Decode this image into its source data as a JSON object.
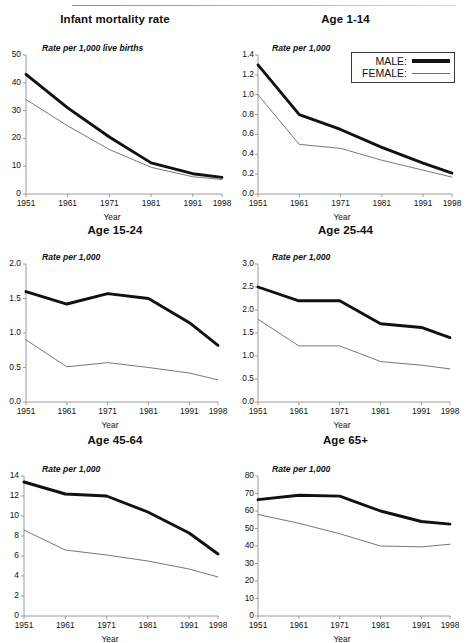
{
  "legend": {
    "male_label": "MALE:",
    "female_label": "FEMALE:",
    "position": "top-right of Age 1-14 panel"
  },
  "axis_titles": {
    "x": "Year",
    "y_infant": "Rate per 1,000 live births",
    "y_standard": "Rate per 1,000"
  },
  "chart_data": [
    {
      "type": "line",
      "title": "Infant mortality rate",
      "xlabel": "Year",
      "ylabel": "Rate per 1,000 live births",
      "x": [
        1951,
        1961,
        1971,
        1981,
        1991,
        1998
      ],
      "xtick_labels": [
        "1951",
        "1961",
        "1971",
        "1981",
        "1991",
        "1998"
      ],
      "ylim": [
        0,
        50
      ],
      "yticks": [
        0,
        10,
        20,
        30,
        40,
        50
      ],
      "ytick_labels": [
        "0",
        "10",
        "20",
        "30",
        "40",
        "50"
      ],
      "grid": false,
      "legend_position": "none",
      "series": [
        {
          "name": "MALE:",
          "values": [
            43.0,
            31.0,
            20.5,
            11.2,
            7.3,
            6.0
          ]
        },
        {
          "name": "FEMALE:",
          "values": [
            34.0,
            24.5,
            16.0,
            9.6,
            6.2,
            5.2
          ]
        }
      ]
    },
    {
      "type": "line",
      "title": "Age 1-14",
      "xlabel": "Year",
      "ylabel": "Rate per 1,000",
      "x": [
        1951,
        1961,
        1971,
        1981,
        1991,
        1998
      ],
      "xtick_labels": [
        "1951",
        "1961",
        "1971",
        "1981",
        "1991",
        "1998"
      ],
      "ylim": [
        0.0,
        1.4
      ],
      "yticks": [
        0.0,
        0.2,
        0.4,
        0.6,
        0.8,
        1.0,
        1.2,
        1.4
      ],
      "ytick_labels": [
        "0.0",
        "0.2",
        "0.4",
        "0.6",
        "0.8",
        "1.0",
        "1.2",
        "1.4"
      ],
      "grid": false,
      "legend_position": "upper-right",
      "series": [
        {
          "name": "MALE:",
          "values": [
            1.3,
            0.8,
            0.65,
            0.47,
            0.31,
            0.21
          ]
        },
        {
          "name": "FEMALE:",
          "values": [
            1.0,
            0.5,
            0.46,
            0.34,
            0.24,
            0.17
          ]
        }
      ]
    },
    {
      "type": "line",
      "title": "Age 15-24",
      "xlabel": "Year",
      "ylabel": "Rate per 1,000",
      "x": [
        1951,
        1961,
        1971,
        1981,
        1991,
        1998
      ],
      "xtick_labels": [
        "1951",
        "1961",
        "1971",
        "1981",
        "1991",
        "1998"
      ],
      "ylim": [
        0.0,
        2.0
      ],
      "yticks": [
        0.0,
        0.5,
        1.0,
        1.5,
        2.0
      ],
      "ytick_labels": [
        "0.0",
        "0.5",
        "1.0",
        "1.5",
        "2.0"
      ],
      "grid": false,
      "legend_position": "none",
      "series": [
        {
          "name": "MALE:",
          "values": [
            1.6,
            1.42,
            1.57,
            1.5,
            1.15,
            0.82
          ]
        },
        {
          "name": "FEMALE:",
          "values": [
            0.9,
            0.51,
            0.57,
            0.5,
            0.42,
            0.32
          ]
        }
      ]
    },
    {
      "type": "line",
      "title": "Age 25-44",
      "xlabel": "Year",
      "ylabel": "Rate per 1,000",
      "x": [
        1951,
        1961,
        1971,
        1981,
        1991,
        1998
      ],
      "xtick_labels": [
        "1951",
        "1961",
        "1971",
        "1981",
        "1991",
        "1998"
      ],
      "ylim": [
        0.0,
        3.0
      ],
      "yticks": [
        0.0,
        0.5,
        1.0,
        1.5,
        2.0,
        2.5,
        3.0
      ],
      "ytick_labels": [
        "0.0",
        "0.5",
        "1.0",
        "1.5",
        "2.0",
        "2.5",
        "3.0"
      ],
      "grid": false,
      "legend_position": "none",
      "series": [
        {
          "name": "MALE:",
          "values": [
            2.5,
            2.2,
            2.2,
            1.7,
            1.62,
            1.4
          ]
        },
        {
          "name": "FEMALE:",
          "values": [
            1.8,
            1.22,
            1.22,
            0.88,
            0.8,
            0.72
          ]
        }
      ]
    },
    {
      "type": "line",
      "title": "Age 45-64",
      "xlabel": "Year",
      "ylabel": "Rate per 1,000",
      "x": [
        1951,
        1961,
        1971,
        1981,
        1991,
        1998
      ],
      "xtick_labels": [
        "1951",
        "1961",
        "1971",
        "1981",
        "1991",
        "1998"
      ],
      "ylim": [
        0,
        14
      ],
      "yticks": [
        0,
        2,
        4,
        6,
        8,
        10,
        12,
        14
      ],
      "ytick_labels": [
        "0",
        "2",
        "4",
        "6",
        "8",
        "10",
        "12",
        "14"
      ],
      "grid": false,
      "legend_position": "none",
      "series": [
        {
          "name": "MALE:",
          "values": [
            13.4,
            12.2,
            12.0,
            10.4,
            8.3,
            6.2
          ]
        },
        {
          "name": "FEMALE:",
          "values": [
            8.6,
            6.6,
            6.1,
            5.5,
            4.7,
            3.9
          ]
        }
      ]
    },
    {
      "type": "line",
      "title": "Age 65+",
      "xlabel": "Year",
      "ylabel": "Rate per 1,000",
      "x": [
        1951,
        1961,
        1971,
        1981,
        1991,
        1998
      ],
      "xtick_labels": [
        "1951",
        "1961",
        "1971",
        "1981",
        "1991",
        "1998"
      ],
      "ylim": [
        0,
        80
      ],
      "yticks": [
        0,
        10,
        20,
        30,
        40,
        50,
        60,
        70,
        80
      ],
      "ytick_labels": [
        "0",
        "10",
        "20",
        "30",
        "40",
        "50",
        "60",
        "70",
        "80"
      ],
      "grid": false,
      "legend_position": "none",
      "series": [
        {
          "name": "MALE:",
          "values": [
            66.5,
            69.0,
            68.5,
            60.0,
            54.0,
            52.5
          ]
        },
        {
          "name": "FEMALE:",
          "values": [
            58.0,
            53.0,
            47.0,
            40.0,
            39.5,
            41.0
          ]
        }
      ]
    }
  ],
  "colors": {
    "male_line": "#111111",
    "female_line": "#777777",
    "axis": "#9a9a9a",
    "text": "#111111"
  }
}
